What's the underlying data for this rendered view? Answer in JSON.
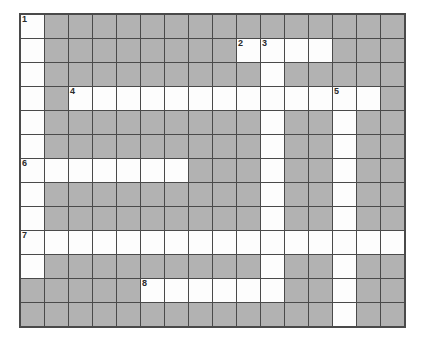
{
  "puzzle": {
    "title": "Crossword Puzzle Grid",
    "rows": 13,
    "cols": 16,
    "cell_size_px": 25,
    "colors": {
      "open_cell": "#fdfdfd",
      "block_cell": "#b2b2b2",
      "grid_line": "#4a4a4a",
      "clue_number": "#2a2a2a",
      "page_background": "#ffffff"
    },
    "clue_numbers": [
      {
        "number": "1",
        "row": 1,
        "col": 1
      },
      {
        "number": "2",
        "row": 2,
        "col": 10
      },
      {
        "number": "3",
        "row": 2,
        "col": 11
      },
      {
        "number": "4",
        "row": 4,
        "col": 3
      },
      {
        "number": "5",
        "row": 4,
        "col": 14
      },
      {
        "number": "6",
        "row": 7,
        "col": 1
      },
      {
        "number": "7",
        "row": 10,
        "col": 1
      },
      {
        "number": "8",
        "row": 12,
        "col": 6
      }
    ],
    "grid": [
      [
        "open",
        "block",
        "block",
        "block",
        "block",
        "block",
        "block",
        "block",
        "block",
        "block",
        "block",
        "block",
        "block",
        "block",
        "block",
        "block"
      ],
      [
        "open",
        "block",
        "block",
        "block",
        "block",
        "block",
        "block",
        "block",
        "block",
        "open",
        "open",
        "open",
        "open",
        "block",
        "block",
        "block"
      ],
      [
        "open",
        "block",
        "block",
        "block",
        "block",
        "block",
        "block",
        "block",
        "block",
        "block",
        "open",
        "block",
        "block",
        "block",
        "block",
        "block"
      ],
      [
        "open",
        "block",
        "open",
        "open",
        "open",
        "open",
        "open",
        "open",
        "open",
        "open",
        "open",
        "open",
        "open",
        "open",
        "open",
        "block"
      ],
      [
        "open",
        "block",
        "block",
        "block",
        "block",
        "block",
        "block",
        "block",
        "block",
        "block",
        "open",
        "block",
        "block",
        "open",
        "block",
        "block"
      ],
      [
        "open",
        "block",
        "block",
        "block",
        "block",
        "block",
        "block",
        "block",
        "block",
        "block",
        "open",
        "block",
        "block",
        "open",
        "block",
        "block"
      ],
      [
        "open",
        "open",
        "open",
        "open",
        "open",
        "open",
        "open",
        "block",
        "block",
        "block",
        "open",
        "block",
        "block",
        "open",
        "block",
        "block"
      ],
      [
        "open",
        "block",
        "block",
        "block",
        "block",
        "block",
        "block",
        "block",
        "block",
        "block",
        "open",
        "block",
        "block",
        "open",
        "block",
        "block"
      ],
      [
        "open",
        "block",
        "block",
        "block",
        "block",
        "block",
        "block",
        "block",
        "block",
        "block",
        "open",
        "block",
        "block",
        "open",
        "block",
        "block"
      ],
      [
        "open",
        "open",
        "open",
        "open",
        "open",
        "open",
        "open",
        "open",
        "open",
        "open",
        "open",
        "open",
        "open",
        "open",
        "open",
        "open"
      ],
      [
        "open",
        "block",
        "block",
        "block",
        "block",
        "block",
        "block",
        "block",
        "block",
        "block",
        "open",
        "block",
        "block",
        "open",
        "block",
        "block"
      ],
      [
        "block",
        "block",
        "block",
        "block",
        "block",
        "open",
        "open",
        "open",
        "open",
        "open",
        "open",
        "block",
        "block",
        "open",
        "block",
        "block"
      ],
      [
        "block",
        "block",
        "block",
        "block",
        "block",
        "block",
        "block",
        "block",
        "block",
        "block",
        "block",
        "block",
        "block",
        "open",
        "block",
        "block"
      ]
    ]
  }
}
